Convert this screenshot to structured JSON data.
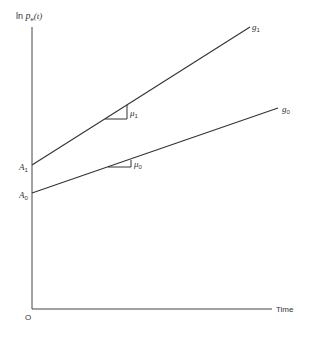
{
  "diagram": {
    "y_axis": {
      "label_prefix": "ln ",
      "label_var": "p",
      "label_sub": "e",
      "label_suffix": "(t)"
    },
    "x_axis": {
      "label": "Time",
      "origin": "O"
    },
    "lines": [
      {
        "name": "g",
        "sub": "1",
        "intercept": "A",
        "intercept_sub": "1",
        "slope": "μ",
        "slope_sub": "1"
      },
      {
        "name": "g",
        "sub": "0",
        "intercept": "A",
        "intercept_sub": "0",
        "slope": "μ",
        "slope_sub": "0"
      }
    ]
  }
}
